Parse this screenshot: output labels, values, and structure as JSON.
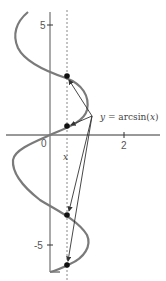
{
  "diagram": {
    "curve_label": {
      "prefix": "y = ",
      "func": "arcsin(",
      "var": "x",
      "suffix": ")",
      "full": "y = arcsin(x)"
    },
    "axes": {
      "x_ticks": [
        {
          "value": "0",
          "label": "0"
        },
        {
          "value": "2",
          "label": "2"
        }
      ],
      "y_ticks": [
        {
          "value": "5",
          "label": "5"
        },
        {
          "value": "-5",
          "label": "-5"
        }
      ],
      "x_marker_label": "x"
    },
    "intersection_points_count": 4,
    "colors": {
      "curve": "#7a7a7a",
      "axis": "#333333",
      "dashed_line": "#888888",
      "points": "#111111",
      "arrows": "#333333"
    }
  }
}
